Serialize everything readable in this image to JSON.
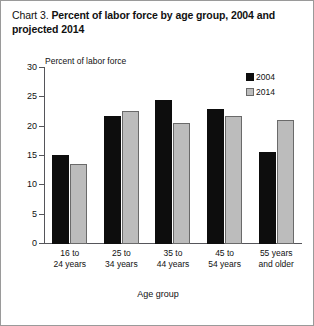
{
  "figure": {
    "title_prefix": "Chart 3.",
    "title_main": "Percent of labor force by age group, 2004 and projected 2014",
    "border_color": "#9a9a9a",
    "background": "#ffffff"
  },
  "chart_data": {
    "type": "bar",
    "title": "Chart 3. Percent of labor force by age group, 2004 and projected 2014",
    "xlabel": "Age group",
    "ylabel": "Percent of labor force",
    "categories": [
      "16 to 24 years",
      "25 to 34 years",
      "35 to 44 years",
      "45 to 54 years",
      "55 years and older"
    ],
    "series": [
      {
        "name": "2004",
        "color": "#0d0d0d",
        "values": [
          15.2,
          21.8,
          24.6,
          23.0,
          15.6
        ]
      },
      {
        "name": "2014",
        "color": "#bcbcbc",
        "values": [
          13.7,
          22.6,
          20.6,
          21.9,
          21.2
        ]
      }
    ],
    "ylim": [
      0,
      30
    ],
    "yticks": [
      0,
      5,
      10,
      15,
      20,
      25,
      30
    ],
    "ytick_labels": [
      "0",
      "5",
      "10",
      "15",
      "20",
      "25",
      "30"
    ],
    "grid": false,
    "legend_position": "upper right"
  },
  "legend": {
    "entries": [
      {
        "label": "2004",
        "swatch": "black-square-swatch"
      },
      {
        "label": "2014",
        "swatch": "gray-square-swatch"
      }
    ]
  }
}
